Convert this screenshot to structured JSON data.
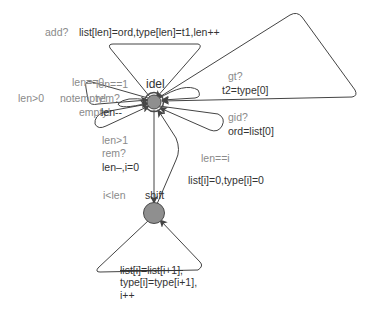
{
  "diagram": {
    "type": "timed-automaton",
    "colors": {
      "edge": "#444444",
      "node_fill": "#8f8f8f",
      "node_stroke": "#4a4a4a",
      "guard_text": "#8a8a8a",
      "update_text": "#333333"
    },
    "locations": [
      {
        "id": "idel",
        "name": "idel",
        "initial": true,
        "x": 154,
        "y": 102
      },
      {
        "id": "shift",
        "name": "shift",
        "initial": false,
        "x": 154,
        "y": 213
      }
    ],
    "labels": {
      "idel_name": "idel",
      "shift_name": "shift",
      "add_sync": "add?",
      "add_update": "list[len]=ord,type[len]=t1,len++",
      "gt_sync": "gt?",
      "gt_update": "t2=type[0]",
      "gid_sync": "gid?",
      "gid_update": "ord=list[0]",
      "len0_guard": "len==0",
      "len1_guard": "len==1",
      "lengt0_guard": "len>0",
      "notempty_sync": "notempty!",
      "rem_sync": "rem?",
      "empty_sync": "empty!",
      "len_dec": "len--",
      "lengt1_guard": "len>1",
      "rem2_sync": "rem?",
      "rem2_update": "len–,i=0",
      "leni_guard": "len==i",
      "leni_update": "list[i]=0,type[i]=0",
      "ilen_guard": "i<len",
      "shift_update_1": "list[i]=list[i+1],",
      "shift_update_2": "type[i]=type[i+1],",
      "shift_update_3": "i++"
    },
    "edges": [
      {
        "from": "idel",
        "to": "idel",
        "sync": "add?",
        "update": "list[len]=ord,type[len]=t1,len++"
      },
      {
        "from": "idel",
        "to": "idel",
        "sync": "gt?",
        "update": "t2=type[0]"
      },
      {
        "from": "idel",
        "to": "idel",
        "sync": "gid?",
        "update": "ord=list[0]"
      },
      {
        "from": "idel",
        "to": "idel",
        "guard": "len==0",
        "sync": "empty!"
      },
      {
        "from": "idel",
        "to": "idel",
        "guard": "len>0",
        "sync": "notempty!"
      },
      {
        "from": "idel",
        "to": "idel",
        "guard": "len==1",
        "sync": "rem?",
        "update": "len--"
      },
      {
        "from": "idel",
        "to": "shift",
        "guard": "len>1",
        "sync": "rem?",
        "update": "len–,i=0"
      },
      {
        "from": "shift",
        "to": "idel",
        "guard": "len==i",
        "update": "list[i]=0,type[i]=0"
      },
      {
        "from": "shift",
        "to": "shift",
        "guard": "i<len",
        "update": "list[i]=list[i+1], type[i]=type[i+1], i++"
      }
    ]
  }
}
